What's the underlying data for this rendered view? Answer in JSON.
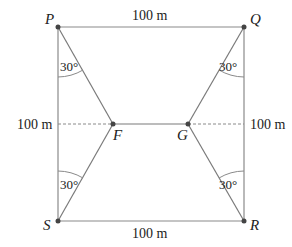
{
  "diagram": {
    "type": "geometry",
    "points": {
      "P": {
        "label": "P",
        "x": 58,
        "y": 27
      },
      "Q": {
        "label": "Q",
        "x": 244,
        "y": 27
      },
      "R": {
        "label": "R",
        "x": 244,
        "y": 221
      },
      "S": {
        "label": "S",
        "x": 58,
        "y": 221
      },
      "F": {
        "label": "F",
        "x": 113,
        "y": 124
      },
      "G": {
        "label": "G",
        "x": 188,
        "y": 124
      }
    },
    "dimensions": {
      "top": "100 m",
      "bottom": "100 m",
      "left": "100 m",
      "right": "100 m"
    },
    "angles": {
      "P": "30°",
      "Q": "30°",
      "S": "30°",
      "R": "30°"
    },
    "colors": {
      "line": "#8a8a8a",
      "point": "#444444",
      "text": "#222222"
    }
  }
}
